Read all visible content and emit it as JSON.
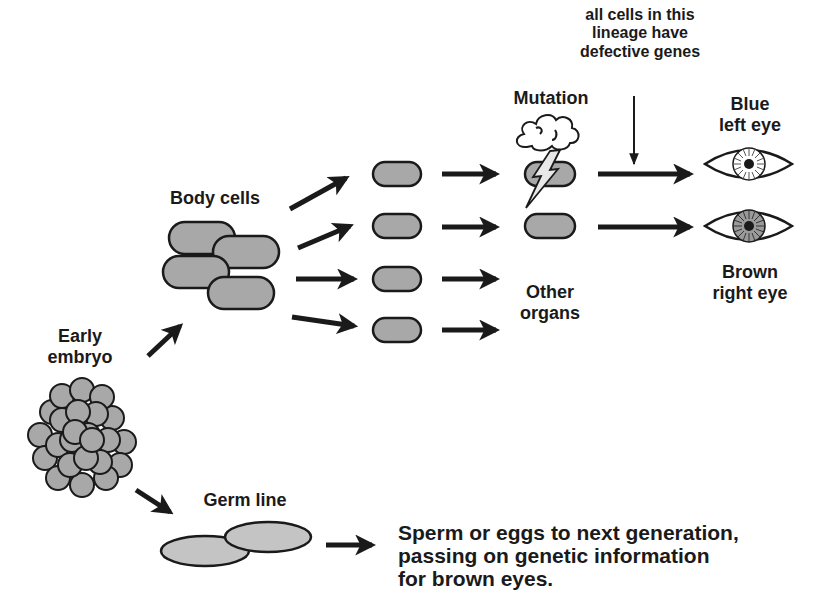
{
  "diagram": {
    "title_implied": "Somatic mutation vs germ line inheritance",
    "labels": {
      "annotation": "all cells in this lineage have defective genes",
      "annotation_lines": [
        "all cells in this",
        "lineage have",
        "defective genes"
      ],
      "mutation": "Mutation",
      "blue_eye": [
        "Blue",
        "left eye"
      ],
      "brown_eye": [
        "Brown",
        "right eye"
      ],
      "body_cells": "Body cells",
      "early_embryo": [
        "Early",
        "embryo"
      ],
      "other_organs": [
        "Other",
        "organs"
      ],
      "germ_line": "Germ line",
      "germ_output": [
        "Sperm or eggs to next generation,",
        "passing on genetic information",
        "for brown eyes."
      ]
    },
    "nodes": [
      {
        "id": "early-embryo",
        "shape": "cell-cluster"
      },
      {
        "id": "body-cells",
        "shape": "capsule-group",
        "count": 4
      },
      {
        "id": "lineage-cells",
        "shape": "capsule",
        "count": 4
      },
      {
        "id": "mutated-cell",
        "shape": "capsule",
        "marker": "storm-cloud-lightning"
      },
      {
        "id": "normal-cell",
        "shape": "capsule"
      },
      {
        "id": "blue-left-eye",
        "shape": "eye",
        "iris": "light"
      },
      {
        "id": "brown-right-eye",
        "shape": "eye",
        "iris": "dark"
      },
      {
        "id": "germ-line",
        "shape": "ellipse-pair"
      }
    ],
    "colors": {
      "stroke": "#1a1a1a",
      "cell_fill": "#a8a8a8",
      "germ_fill": "#c4c4c4",
      "iris_brown": "#9a9a9a",
      "background": "#ffffff"
    }
  }
}
